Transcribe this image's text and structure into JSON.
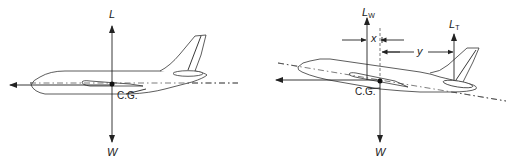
{
  "figures": [
    {
      "id": "level-flight",
      "labels": {
        "lift": "L",
        "weight": "W",
        "cg": "C.G."
      }
    },
    {
      "id": "pitched-flight",
      "labels": {
        "wing_lift_main": "L",
        "wing_lift_sub": "W",
        "tail_lift_main": "L",
        "tail_lift_sub": "T",
        "weight": "W",
        "cg": "C.G.",
        "dim_x": "x",
        "dim_y": "y"
      }
    }
  ]
}
